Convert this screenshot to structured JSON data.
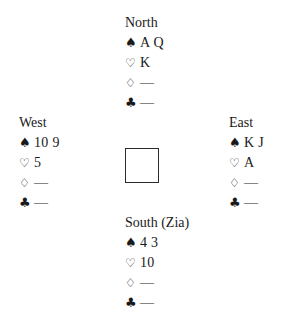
{
  "diagram": {
    "type": "bridge-deal",
    "suit_symbols": {
      "spades": "♠",
      "hearts": "♡",
      "diamonds": "♢",
      "clubs": "♣"
    },
    "hands": {
      "north": {
        "label": "North",
        "spades": "A Q",
        "hearts": "K",
        "diamonds": "—",
        "clubs": "—"
      },
      "west": {
        "label": "West",
        "spades": "10 9",
        "hearts": "5",
        "diamonds": "—",
        "clubs": "—"
      },
      "east": {
        "label": "East",
        "spades": "K J",
        "hearts": "A",
        "diamonds": "—",
        "clubs": "—"
      },
      "south": {
        "label": "South (Zia)",
        "spades": "4 3",
        "hearts": "10",
        "diamonds": "—",
        "clubs": "—"
      }
    }
  }
}
